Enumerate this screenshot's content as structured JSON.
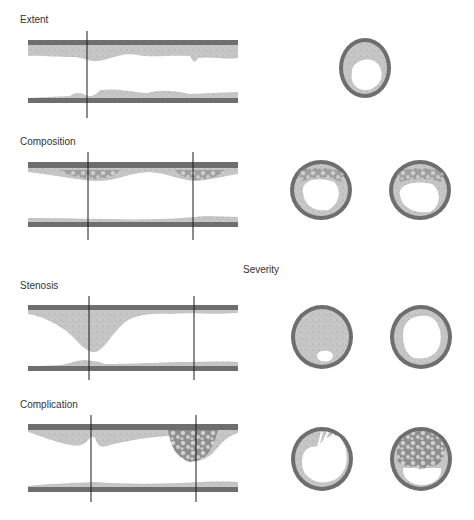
{
  "panels": [
    {
      "id": "extent",
      "label": "Extent",
      "label_pos": [
        20,
        17
      ]
    },
    {
      "id": "composition",
      "label": "Composition",
      "label_pos": [
        20,
        139
      ]
    },
    {
      "id": "stenosis",
      "label": "Stenosis",
      "label_pos": [
        20,
        281
      ]
    },
    {
      "id": "complication",
      "label": "Complication",
      "label_pos": [
        20,
        401
      ]
    }
  ],
  "severity_label": "Severity",
  "colors": {
    "wall": "#6e6e6e",
    "plaque": "#c4c4c4",
    "calcified": "#a9a9a9",
    "lumen": "#ffffff",
    "cut_line": "#1a1a1a",
    "text": "#333333"
  }
}
